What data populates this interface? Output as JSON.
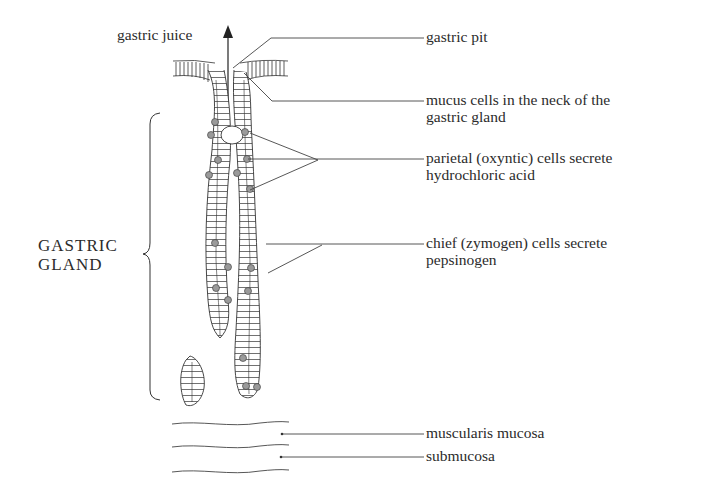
{
  "diagram": {
    "type": "labeled anatomical illustration",
    "subject": "gastric gland",
    "top_label": "gastric juice",
    "bracket_label": [
      "GASTRIC",
      "GLAND"
    ],
    "labels": [
      {
        "id": "gastric-pit",
        "lines": [
          "gastric pit"
        ]
      },
      {
        "id": "mucus-cells",
        "lines": [
          "mucus cells in the neck of the",
          "gastric gland"
        ]
      },
      {
        "id": "parietal-cells",
        "lines": [
          "parietal (oxyntic) cells secrete",
          "hydrochloric acid"
        ]
      },
      {
        "id": "chief-cells",
        "lines": [
          "chief (zymogen) cells secrete",
          "pepsinogen"
        ]
      },
      {
        "id": "muscularis-mucosa",
        "lines": [
          "muscularis mucosa"
        ]
      },
      {
        "id": "submucosa",
        "lines": [
          "submucosa"
        ]
      }
    ],
    "colors": {
      "ink": "#2b2b2b",
      "background": "#ffffff",
      "secretory_cell_fill": "#9a9a9a"
    }
  }
}
